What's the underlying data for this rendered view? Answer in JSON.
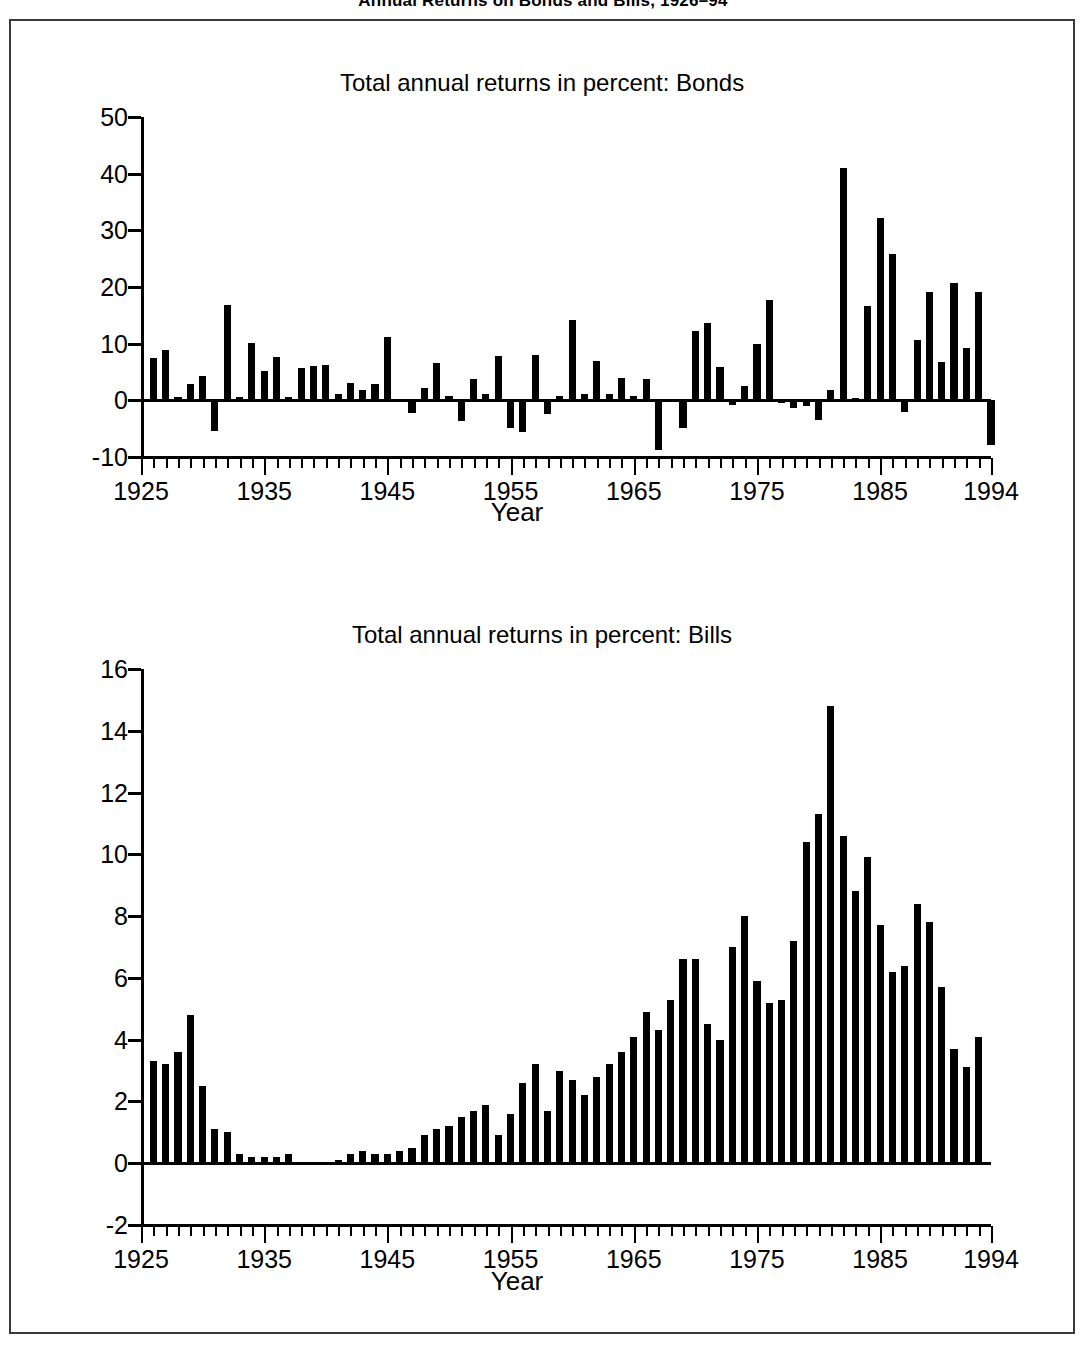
{
  "figure": {
    "title": "Annual Returns on Bonds and Bills, 1926–94",
    "axis_title": "Year",
    "bar_color": "#000000",
    "frame_color": "#3a3a3a"
  },
  "chart_data": [
    {
      "type": "bar",
      "title": "Total annual returns in percent: Bonds",
      "xlabel": "Year",
      "ylabel": "",
      "ylim": [
        -10,
        50
      ],
      "yticks": [
        -10,
        0,
        10,
        20,
        30,
        40,
        50
      ],
      "ytick_labels": [
        "-10",
        "0",
        "10",
        "20",
        "30",
        "40",
        "50"
      ],
      "xlim": [
        1925,
        1994
      ],
      "xticks": [
        1925,
        1935,
        1945,
        1955,
        1965,
        1975,
        1985,
        1994
      ],
      "xtick_labels": [
        "1925",
        "1935",
        "1945",
        "1955",
        "1965",
        "1975",
        "1985",
        "1994"
      ],
      "grid": false,
      "legend": "none",
      "categories": [
        1926,
        1927,
        1928,
        1929,
        1930,
        1931,
        1932,
        1933,
        1934,
        1935,
        1936,
        1937,
        1938,
        1939,
        1940,
        1941,
        1942,
        1943,
        1944,
        1945,
        1946,
        1947,
        1948,
        1949,
        1950,
        1951,
        1952,
        1953,
        1954,
        1955,
        1956,
        1957,
        1958,
        1959,
        1960,
        1961,
        1962,
        1963,
        1964,
        1965,
        1966,
        1967,
        1968,
        1969,
        1970,
        1971,
        1972,
        1973,
        1974,
        1975,
        1976,
        1977,
        1978,
        1979,
        1980,
        1981,
        1982,
        1983,
        1984,
        1985,
        1986,
        1987,
        1988,
        1989,
        1990,
        1991,
        1992,
        1993,
        1994
      ],
      "values": [
        7.4,
        8.9,
        0.6,
        2.8,
        4.3,
        -5.4,
        16.8,
        0.6,
        10.1,
        5.1,
        7.6,
        0.6,
        5.7,
        6.1,
        6.2,
        1.2,
        3.0,
        1.8,
        2.8,
        11.2,
        -0.3,
        -2.2,
        2.1,
        6.6,
        0.8,
        -3.7,
        3.8,
        1.2,
        7.8,
        -4.9,
        -5.6,
        8.0,
        -2.4,
        0.8,
        14.1,
        1.1,
        7.0,
        1.2,
        3.9,
        0.7,
        3.8,
        -8.7,
        0.3,
        -4.9,
        12.3,
        13.7,
        5.8,
        -0.8,
        2.6,
        10.0,
        17.7,
        -0.4,
        -1.3,
        -1.0,
        -3.4,
        1.9,
        41.0,
        0.5,
        16.7,
        32.2,
        25.9,
        -2.0,
        10.7,
        19.2,
        6.8,
        20.7,
        9.2,
        19.2,
        -7.8
      ]
    },
    {
      "type": "bar",
      "title": "Total annual returns in percent: Bills",
      "xlabel": "Year",
      "ylabel": "",
      "ylim": [
        -2,
        16
      ],
      "yticks": [
        -2,
        0,
        2,
        4,
        6,
        8,
        10,
        12,
        14,
        16
      ],
      "ytick_labels": [
        "-2",
        "0",
        "2",
        "4",
        "6",
        "8",
        "10",
        "12",
        "14",
        "16"
      ],
      "xlim": [
        1925,
        1994
      ],
      "xticks": [
        1925,
        1935,
        1945,
        1955,
        1965,
        1975,
        1985,
        1994
      ],
      "xtick_labels": [
        "1925",
        "1935",
        "1945",
        "1955",
        "1965",
        "1975",
        "1985",
        "1994"
      ],
      "grid": false,
      "legend": "none",
      "categories": [
        1926,
        1927,
        1928,
        1929,
        1930,
        1931,
        1932,
        1933,
        1934,
        1935,
        1936,
        1937,
        1938,
        1939,
        1940,
        1941,
        1942,
        1943,
        1944,
        1945,
        1946,
        1947,
        1948,
        1949,
        1950,
        1951,
        1952,
        1953,
        1954,
        1955,
        1956,
        1957,
        1958,
        1959,
        1960,
        1961,
        1962,
        1963,
        1964,
        1965,
        1966,
        1967,
        1968,
        1969,
        1970,
        1971,
        1972,
        1973,
        1974,
        1975,
        1976,
        1977,
        1978,
        1979,
        1980,
        1981,
        1982,
        1983,
        1984,
        1985,
        1986,
        1987,
        1988,
        1989,
        1990,
        1991,
        1992,
        1993,
        1994
      ],
      "values": [
        3.3,
        3.2,
        3.6,
        4.8,
        2.5,
        1.1,
        1.0,
        0.3,
        0.2,
        0.2,
        0.2,
        0.3,
        0.0,
        0.0,
        0.0,
        0.1,
        0.3,
        0.4,
        0.3,
        0.3,
        0.4,
        0.5,
        0.9,
        1.1,
        1.2,
        1.5,
        1.7,
        1.9,
        0.9,
        1.6,
        2.6,
        3.2,
        1.7,
        3.0,
        2.7,
        2.2,
        2.8,
        3.2,
        3.6,
        4.1,
        4.9,
        4.3,
        5.3,
        6.6,
        6.6,
        4.5,
        4.0,
        7.0,
        8.0,
        5.9,
        5.2,
        5.3,
        7.2,
        10.4,
        11.3,
        14.8,
        10.6,
        8.8,
        9.9,
        7.7,
        6.2,
        6.4,
        8.4,
        7.8,
        5.7,
        3.7,
        3.1,
        4.1
      ]
    }
  ]
}
